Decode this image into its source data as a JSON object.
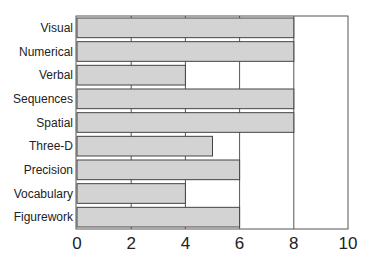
{
  "chart_data": {
    "type": "bar",
    "orientation": "horizontal",
    "title": "",
    "xlabel": "",
    "ylabel": "",
    "categories": [
      "Visual",
      "Numerical",
      "Verbal",
      "Sequences",
      "Spatial",
      "Three-D",
      "Precision",
      "Vocabulary",
      "Figurework"
    ],
    "values": [
      8,
      8,
      4,
      8,
      8,
      5,
      6,
      4,
      6
    ],
    "xlim": [
      0,
      10
    ],
    "xticks": [
      0,
      2,
      4,
      6,
      8,
      10
    ],
    "xtick_labels": [
      "0",
      "2",
      "4",
      "6",
      "8",
      "10"
    ],
    "grid": "vertical",
    "legend": "none",
    "bar_color": "#d3d3d3",
    "bar_edge_color": "#444444"
  }
}
